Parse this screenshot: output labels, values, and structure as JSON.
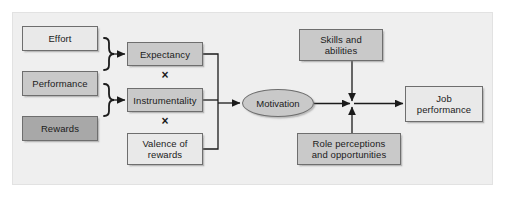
{
  "diagram": {
    "type": "flow-diagram",
    "canvas": {
      "width": 505,
      "height": 199
    },
    "frame": {
      "x": 12,
      "y": 12,
      "width": 481,
      "height": 173,
      "fill": "#efefef",
      "border": "#e2e2e2"
    },
    "palette": {
      "light": "#e9e9e9",
      "mid": "#c9c9c9",
      "dark": "#a8a8a8",
      "outline": "#6e6e6e",
      "wire": "#1b1b1b",
      "text": "#1b1b1b"
    },
    "inputs": [
      {
        "id": "effort",
        "label": "Effort",
        "tone": "light",
        "x": 22,
        "y": 26,
        "w": 76,
        "h": 25
      },
      {
        "id": "performance",
        "label": "Performance",
        "tone": "mid",
        "x": 22,
        "y": 71,
        "w": 76,
        "h": 25
      },
      {
        "id": "rewards",
        "label": "Rewards",
        "tone": "dark",
        "x": 22,
        "y": 116,
        "w": 76,
        "h": 25
      }
    ],
    "components": [
      {
        "id": "expectancy",
        "label": "Expectancy",
        "tone": "mid",
        "x": 127,
        "y": 42,
        "w": 76,
        "h": 24
      },
      {
        "id": "instrumentality",
        "label": "Instrumentality",
        "tone": "mid",
        "x": 127,
        "y": 88,
        "w": 76,
        "h": 24
      },
      {
        "id": "valence",
        "label": "Valence of\nrewards",
        "tone": "light",
        "x": 127,
        "y": 133,
        "w": 76,
        "h": 32
      }
    ],
    "operators": [
      {
        "id": "times-1",
        "symbol": "×",
        "x": 158,
        "y": 68
      },
      {
        "id": "times-2",
        "symbol": "×",
        "x": 158,
        "y": 114
      }
    ],
    "motivation": {
      "id": "motivation",
      "label": "Motivation",
      "x": 242,
      "y": 89,
      "w": 72,
      "h": 28
    },
    "moderators": [
      {
        "id": "skills",
        "label": "Skills and\nabilities",
        "tone": "mid",
        "x": 299,
        "y": 29,
        "w": 84,
        "h": 32
      },
      {
        "id": "role",
        "label": "Role perceptions\nand opportunities",
        "tone": "mid",
        "x": 297,
        "y": 133,
        "w": 104,
        "h": 32
      }
    ],
    "outcome": {
      "id": "job-performance",
      "label": "Job\nperformance",
      "tone": "light",
      "x": 405,
      "y": 86,
      "w": 78,
      "h": 36
    },
    "junction": {
      "x": 352,
      "y": 104
    },
    "braces": [
      {
        "id": "brace-expectancy",
        "from": [
          "effort",
          "performance"
        ],
        "to": "expectancy"
      },
      {
        "id": "brace-instrumentality",
        "from": [
          "performance",
          "rewards"
        ],
        "to": "instrumentality"
      }
    ],
    "edges": [
      {
        "id": "edge-expectancy-bus",
        "from": "expectancy",
        "to": "bus"
      },
      {
        "id": "edge-instrumentality-bus",
        "from": "instrumentality",
        "to": "bus"
      },
      {
        "id": "edge-valence-bus",
        "from": "valence",
        "to": "bus"
      },
      {
        "id": "edge-bus-motivation",
        "from": "bus",
        "to": "motivation",
        "arrow": true
      },
      {
        "id": "edge-motivation-junction",
        "from": "motivation",
        "to": "junction",
        "arrow": true
      },
      {
        "id": "edge-skills-junction",
        "from": "skills",
        "to": "junction",
        "arrow": true
      },
      {
        "id": "edge-role-junction",
        "from": "role",
        "to": "junction",
        "arrow": true
      },
      {
        "id": "edge-junction-outcome",
        "from": "junction",
        "to": "job-performance",
        "arrow": true
      }
    ]
  }
}
